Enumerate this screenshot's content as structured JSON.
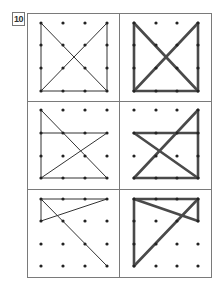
{
  "exercise": {
    "number": "10",
    "colors": {
      "border": "#7a7a7a",
      "dot": "#222222",
      "thin_line": "#333333",
      "thick_line": "#4a4a4a"
    },
    "grid": {
      "rows": 4,
      "cols": 4
    },
    "cells": [
      {
        "row": 0,
        "side": "left",
        "style": "thin",
        "segments": [
          [
            [
              0,
              0
            ],
            [
              0,
              3
            ]
          ],
          [
            [
              0,
              3
            ],
            [
              3,
              3
            ]
          ],
          [
            [
              3,
              0
            ],
            [
              3,
              3
            ]
          ],
          [
            [
              0,
              0
            ],
            [
              3,
              3
            ]
          ],
          [
            [
              3,
              0
            ],
            [
              0,
              3
            ]
          ]
        ]
      },
      {
        "row": 0,
        "side": "right",
        "style": "thick",
        "segments": [
          [
            [
              0,
              0
            ],
            [
              0,
              3
            ]
          ],
          [
            [
              0,
              3
            ],
            [
              3,
              3
            ]
          ],
          [
            [
              3,
              0
            ],
            [
              3,
              3
            ]
          ],
          [
            [
              0,
              0
            ],
            [
              3,
              3
            ]
          ],
          [
            [
              3,
              0
            ],
            [
              0,
              3
            ]
          ]
        ]
      },
      {
        "row": 1,
        "side": "left",
        "style": "thin",
        "segments": [
          [
            [
              0,
              0
            ],
            [
              0,
              3
            ]
          ],
          [
            [
              0,
              1
            ],
            [
              3,
              1
            ]
          ],
          [
            [
              0,
              0
            ],
            [
              3,
              3
            ]
          ],
          [
            [
              3,
              1
            ],
            [
              0,
              3
            ]
          ],
          [
            [
              0,
              3
            ],
            [
              3,
              3
            ]
          ]
        ]
      },
      {
        "row": 1,
        "side": "right",
        "style": "thick",
        "segments": [
          [
            [
              0,
              1
            ],
            [
              3,
              1
            ]
          ],
          [
            [
              3,
              0
            ],
            [
              3,
              3
            ]
          ],
          [
            [
              3,
              0
            ],
            [
              0,
              3
            ]
          ],
          [
            [
              0,
              1
            ],
            [
              3,
              3
            ]
          ],
          [
            [
              0,
              3
            ],
            [
              3,
              3
            ]
          ]
        ]
      },
      {
        "row": 2,
        "side": "left",
        "style": "thin",
        "segments": [
          [
            [
              0,
              0
            ],
            [
              3,
              0
            ]
          ],
          [
            [
              0,
              0
            ],
            [
              0,
              1
            ]
          ],
          [
            [
              0,
              1
            ],
            [
              3,
              0
            ]
          ],
          [
            [
              0,
              0
            ],
            [
              3,
              3
            ]
          ]
        ]
      },
      {
        "row": 2,
        "side": "right",
        "style": "thick",
        "segments": [
          [
            [
              0,
              0
            ],
            [
              3,
              0
            ]
          ],
          [
            [
              0,
              0
            ],
            [
              0,
              3
            ]
          ],
          [
            [
              0,
              0
            ],
            [
              3,
              1
            ]
          ],
          [
            [
              3,
              0
            ],
            [
              3,
              1
            ]
          ],
          [
            [
              3,
              0
            ],
            [
              0,
              3
            ]
          ]
        ]
      }
    ]
  }
}
